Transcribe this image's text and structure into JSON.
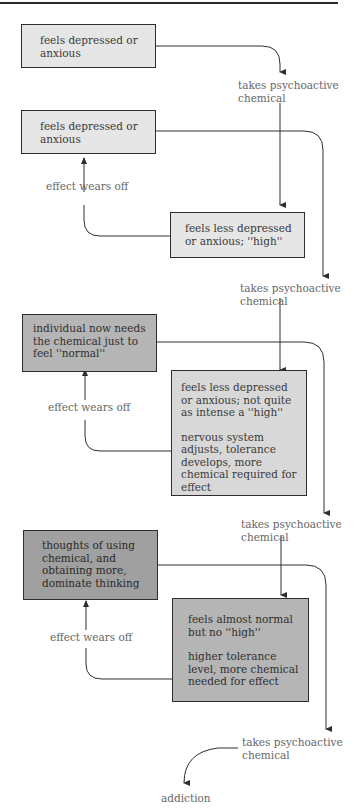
{
  "diagram": {
    "boxes": [
      {
        "id": "b1",
        "text": [
          "feels depressed or",
          "anxious"
        ]
      },
      {
        "id": "b2",
        "text": [
          "feels depressed or",
          "anxious"
        ]
      },
      {
        "id": "b3",
        "text": [
          "feels less depressed",
          "or anxious; ''high''"
        ]
      },
      {
        "id": "b4",
        "text": [
          "individual now needs",
          "the chemical just to",
          "feel ''normal''"
        ]
      },
      {
        "id": "b5",
        "text": [
          "feels less depressed",
          "or anxious; not quite",
          "as intense a ''high''"
        ],
        "text2": [
          "nervous system",
          "adjusts, tolerance",
          "develops, more",
          "chemical required for",
          "effect"
        ]
      },
      {
        "id": "b6",
        "text": [
          "thoughts of using",
          "chemical, and",
          "obtaining more,",
          "dominate thinking"
        ]
      },
      {
        "id": "b7",
        "text": [
          "feels almost normal",
          "but no ''high''"
        ],
        "text2": [
          "higher tolerance",
          "level, more chemical",
          "needed for effect"
        ]
      }
    ],
    "labels": {
      "takes_1": [
        "takes psychoactive",
        "chemical"
      ],
      "takes_2": [
        "takes psychoactive",
        "chemical"
      ],
      "takes_3": [
        "takes psychoactive",
        "chemical"
      ],
      "takes_4": [
        "takes psychoactive",
        "chemical"
      ],
      "wears_1": "effect wears off",
      "wears_2": "effect wears off",
      "wears_3": "effect wears off",
      "addiction": "addiction"
    },
    "colors": {
      "level1": "#e6e6e6",
      "level2": "#d8d8d8",
      "level3": "#b5b5b5",
      "level4": "#a0a0a0",
      "line": "#2e2e2e"
    }
  }
}
